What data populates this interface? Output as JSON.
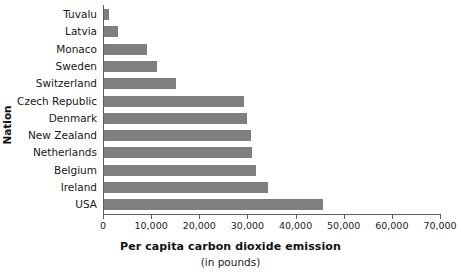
{
  "chart_data": {
    "type": "bar",
    "orientation": "horizontal",
    "title": "",
    "xlabel": "Per capita carbon dioxide emission",
    "xlabel_sub": "(in pounds)",
    "ylabel": "Nation",
    "xlim": [
      0,
      70000
    ],
    "xticks": [
      0,
      10000,
      20000,
      30000,
      40000,
      50000,
      60000,
      70000
    ],
    "xtick_labels": [
      "0",
      "10,000",
      "20,000",
      "30,000",
      "40,000",
      "50,000",
      "60,000",
      "70,000"
    ],
    "grid": false,
    "legend": false,
    "bar_color": "#7f7f7f",
    "axis_color": "#5d5d5d",
    "categories": [
      "Tuvalu",
      "Latvia",
      "Monaco",
      "Sweden",
      "Switzerland",
      "Czech Republic",
      "Denmark",
      "New Zealand",
      "Netherlands",
      "Belgium",
      "Ireland",
      "USA"
    ],
    "values": [
      1000,
      3000,
      9000,
      11000,
      15000,
      29000,
      29700,
      30500,
      30700,
      31500,
      34000,
      45500
    ]
  }
}
